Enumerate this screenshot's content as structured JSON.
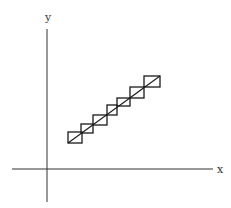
{
  "diagram": {
    "title": "",
    "colors": {
      "background": "#ffffff",
      "axis": "#333333",
      "stroke": "#1a1a1a"
    },
    "axes": {
      "x": {
        "label": "x",
        "from": [
          12,
          169
        ],
        "to": [
          213,
          169
        ],
        "label_pos": [
          217,
          173
        ]
      },
      "y": {
        "label": "y",
        "from": [
          47,
          29
        ],
        "to": [
          47,
          202
        ],
        "label_pos": [
          48,
          21
        ]
      }
    },
    "diagonal_line": {
      "from": [
        68,
        143
      ],
      "to": [
        160,
        76
      ]
    },
    "boxes": [
      {
        "x": 68,
        "y": 132,
        "w": 14,
        "h": 11
      },
      {
        "x": 81,
        "y": 124,
        "w": 12,
        "h": 9
      },
      {
        "x": 93,
        "y": 115,
        "w": 14,
        "h": 10
      },
      {
        "x": 107,
        "y": 105,
        "w": 10,
        "h": 10
      },
      {
        "x": 117,
        "y": 98,
        "w": 13,
        "h": 8
      },
      {
        "x": 130,
        "y": 87,
        "w": 14,
        "h": 11
      },
      {
        "x": 144,
        "y": 76,
        "w": 16,
        "h": 11
      }
    ]
  }
}
